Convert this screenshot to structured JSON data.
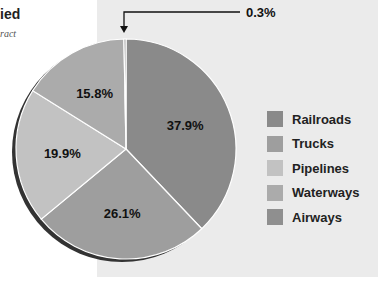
{
  "header": {
    "title_fragment": "ied",
    "subtitle_fragment": "ract"
  },
  "callout": {
    "label": "0.3%"
  },
  "chart_data": {
    "type": "pie",
    "title": "",
    "slices": [
      {
        "name": "Railroads",
        "value": 37.9,
        "label": "37.9%",
        "color": "#8a8a8a"
      },
      {
        "name": "Trucks",
        "value": 26.1,
        "label": "26.1%",
        "color": "#9e9e9e"
      },
      {
        "name": "Pipelines",
        "value": 19.9,
        "label": "19.9%",
        "color": "#c2c2c2"
      },
      {
        "name": "Waterways",
        "value": 15.8,
        "label": "15.8%",
        "color": "#ababab"
      },
      {
        "name": "Airways",
        "value": 0.3,
        "label": "0.3%",
        "color": "#8f8f8f"
      }
    ],
    "legend_position": "right"
  },
  "legend": {
    "items": [
      {
        "label": "Railroads",
        "color": "#8a8a8a"
      },
      {
        "label": "Trucks",
        "color": "#9e9e9e"
      },
      {
        "label": "Pipelines",
        "color": "#c2c2c2"
      },
      {
        "label": "Waterways",
        "color": "#ababab"
      },
      {
        "label": "Airways",
        "color": "#8f8f8f"
      }
    ]
  }
}
